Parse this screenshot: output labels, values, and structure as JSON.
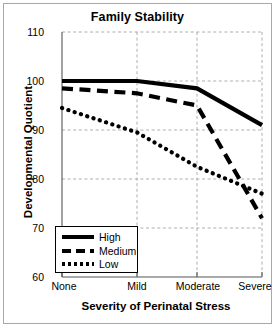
{
  "chart_data": {
    "type": "line",
    "title": "Family Stability",
    "xlabel": "Severity of Perinatal Stress",
    "ylabel": "Developmental Quotient",
    "categories": [
      "None",
      "Mild",
      "Moderate",
      "Severe"
    ],
    "ylim": [
      60,
      110
    ],
    "yticks": [
      110,
      100,
      90,
      80,
      70,
      60
    ],
    "grid": true,
    "legend_position": "bottom-left",
    "series": [
      {
        "name": "High",
        "style": "solid",
        "values": [
          100.0,
          100.0,
          98.5,
          91.0
        ]
      },
      {
        "name": "Medium",
        "style": "dashed",
        "values": [
          98.5,
          97.5,
          95.0,
          72.0
        ]
      },
      {
        "name": "Low",
        "style": "dotted",
        "values": [
          94.5,
          89.5,
          82.5,
          77.0
        ]
      }
    ]
  },
  "axis": {
    "y_tick_labels": [
      "110",
      "100",
      "90",
      "80",
      "70",
      "60"
    ],
    "x_tick_labels": [
      "None",
      "Mild",
      "Moderate",
      "Severe"
    ]
  },
  "legend": {
    "items": [
      {
        "label": "High"
      },
      {
        "label": "Medium"
      },
      {
        "label": "Low"
      }
    ]
  },
  "colors": {
    "line": "#000000",
    "grid": "#999999",
    "axis": "#555555",
    "frame": "#a8a8a8",
    "background": "#ffffff"
  }
}
